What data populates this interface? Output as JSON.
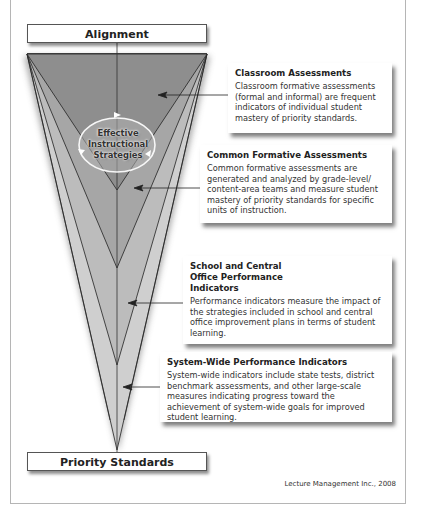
{
  "diagram": {
    "top_label": "Alignment",
    "bottom_label": "Priority Standards",
    "center_label": [
      "Effective",
      "Instructional",
      "Strategies"
    ],
    "credit": "Lecture Management Inc., 2008",
    "colors": {
      "cone_dark": "#8c8c8c",
      "cone_mid": "#a4a4a4",
      "cone_light": "#bdbdbd",
      "cone_lightest": "#cfcfcf",
      "line": "#222222",
      "ellipse_stroke": "#f5f5f5"
    },
    "callouts": [
      {
        "title": "Classroom Assessments",
        "body": "Classroom formative assessments (formal and informal) are frequent indicators of individual student mastery of priority standards."
      },
      {
        "title": "Common Formative Assessments",
        "body": "Common formative assessments are generated and analyzed by grade-level/ content-area teams and measure student mastery of priority standards for specific units of instruction."
      },
      {
        "title": "School and Central Office Performance Indicators",
        "body": "Performance indicators measure the impact of the strategies included in school and central office improvement plans in terms of student learning."
      },
      {
        "title": "System-Wide Performance Indicators",
        "body": "System-wide indicators include state tests, district benchmark assessments, and other large-scale measures indicating progress toward the achievement of system-wide goals for improved student learning."
      }
    ]
  }
}
